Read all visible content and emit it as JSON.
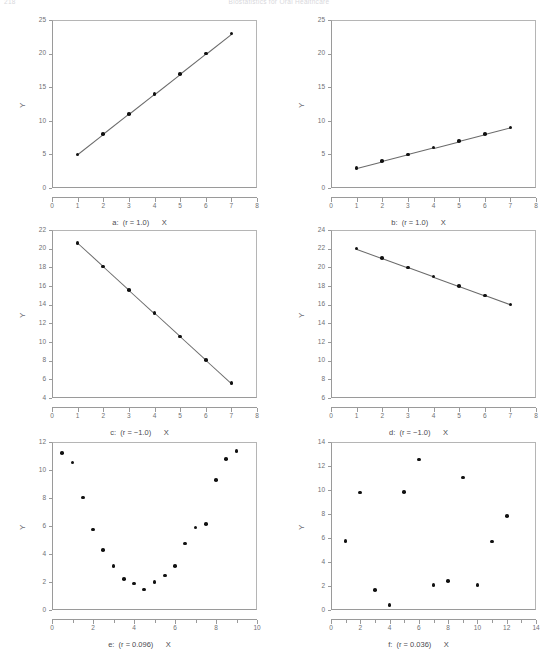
{
  "running_head": {
    "folio": "218",
    "title": "Biostatistics for Oral Healthcare"
  },
  "panels": [
    {
      "id": "a",
      "caption": "a:  (r = 1.0)      X",
      "ylabel": "Y"
    },
    {
      "id": "b",
      "caption": "b:  (r = 1.0)      X",
      "ylabel": "Y"
    },
    {
      "id": "c",
      "caption": "c:  (r = −1.0)      X",
      "ylabel": "Y"
    },
    {
      "id": "d",
      "caption": "d:  (r = −1.0)      X",
      "ylabel": "Y"
    },
    {
      "id": "e",
      "caption": "e:  (r = 0.096)      X",
      "ylabel": "Y"
    },
    {
      "id": "f",
      "caption": "f:  (r = 0.036)      X",
      "ylabel": "Y"
    }
  ],
  "chart_data": [
    {
      "type": "scatter",
      "panel": "a",
      "title": "a:  (r = 1.0)      X",
      "xlabel": "X",
      "ylabel": "Y",
      "xlim": [
        0,
        8
      ],
      "ylim": [
        0,
        25
      ],
      "xticks": [
        0,
        1,
        2,
        3,
        4,
        5,
        6,
        7,
        8
      ],
      "yticks": [
        0,
        5,
        10,
        15,
        20,
        25
      ],
      "grid": false,
      "legend": null,
      "connected": true,
      "x": [
        1,
        2,
        3,
        4,
        5,
        6,
        7
      ],
      "y": [
        5,
        8,
        11,
        14,
        17,
        20,
        23
      ],
      "annotation": "r = 1.0"
    },
    {
      "type": "scatter",
      "panel": "b",
      "title": "b:  (r = 1.0)      X",
      "xlabel": "X",
      "ylabel": "Y",
      "xlim": [
        0,
        8
      ],
      "ylim": [
        0,
        25
      ],
      "xticks": [
        0,
        1,
        2,
        3,
        4,
        5,
        6,
        7,
        8
      ],
      "yticks": [
        0,
        5,
        10,
        15,
        20,
        25
      ],
      "grid": false,
      "legend": null,
      "connected": true,
      "x": [
        1,
        2,
        3,
        4,
        5,
        6,
        7
      ],
      "y": [
        3,
        4,
        5,
        6,
        7,
        8,
        9
      ],
      "annotation": "r = 1.0"
    },
    {
      "type": "scatter",
      "panel": "c",
      "title": "c:  (r = −1.0)      X",
      "xlabel": "X",
      "ylabel": "Y",
      "xlim": [
        0,
        8
      ],
      "ylim": [
        4,
        22
      ],
      "xticks": [
        0,
        1,
        2,
        3,
        4,
        5,
        6,
        7,
        8
      ],
      "yticks": [
        4,
        6,
        8,
        10,
        12,
        14,
        16,
        18,
        20,
        22
      ],
      "grid": false,
      "legend": null,
      "connected": true,
      "x": [
        1,
        2,
        3,
        4,
        5,
        6,
        7
      ],
      "y": [
        20.6,
        18.1,
        15.6,
        13.1,
        10.6,
        8.1,
        5.6
      ],
      "annotation": "r = -1.0"
    },
    {
      "type": "scatter",
      "panel": "d",
      "title": "d:  (r = −1.0)      X",
      "xlabel": "X",
      "ylabel": "Y",
      "xlim": [
        0,
        8
      ],
      "ylim": [
        6,
        24
      ],
      "xticks": [
        0,
        1,
        2,
        3,
        4,
        5,
        6,
        7,
        8
      ],
      "yticks": [
        6,
        8,
        10,
        12,
        14,
        16,
        18,
        20,
        22,
        24
      ],
      "grid": false,
      "legend": null,
      "connected": true,
      "x": [
        1,
        2,
        3,
        4,
        5,
        6,
        7
      ],
      "y": [
        22,
        21,
        20,
        19,
        18,
        17,
        16
      ],
      "annotation": "r = -1.0"
    },
    {
      "type": "scatter",
      "panel": "e",
      "title": "e:  (r = 0.096)      X",
      "xlabel": "X",
      "ylabel": "Y",
      "xlim": [
        0,
        10
      ],
      "ylim": [
        0,
        12
      ],
      "xticks": [
        0,
        2,
        4,
        6,
        8,
        10
      ],
      "yticks": [
        0,
        2,
        4,
        6,
        8,
        10,
        12
      ],
      "grid": false,
      "legend": null,
      "connected": false,
      "x": [
        0.5,
        1.0,
        1.5,
        2.0,
        2.5,
        3.0,
        3.5,
        4.0,
        4.5,
        5.0,
        5.5,
        6.0,
        6.5,
        7.0,
        7.5,
        8.0,
        8.5,
        9.0
      ],
      "y": [
        11.2,
        10.55,
        8.05,
        5.75,
        4.3,
        3.15,
        2.2,
        1.9,
        1.45,
        2.0,
        2.45,
        3.15,
        4.75,
        5.9,
        6.15,
        9.3,
        10.8,
        11.35
      ],
      "annotation": "r = 0.096"
    },
    {
      "type": "scatter",
      "panel": "f",
      "title": "f:  (r = 0.036)      X",
      "xlabel": "X",
      "ylabel": "Y",
      "xlim": [
        0,
        14
      ],
      "ylim": [
        0,
        14
      ],
      "xticks": [
        0,
        2,
        4,
        6,
        8,
        10,
        12,
        14
      ],
      "yticks": [
        0,
        2,
        4,
        6,
        8,
        10,
        12,
        14
      ],
      "grid": false,
      "legend": null,
      "connected": false,
      "x": [
        1,
        2,
        3,
        4,
        5,
        6,
        7,
        8,
        9,
        10,
        11,
        12
      ],
      "y": [
        5.75,
        9.8,
        1.65,
        0.4,
        9.85,
        12.55,
        2.1,
        2.4,
        11.05,
        2.1,
        5.7,
        7.85
      ],
      "annotation": "r = 0.036"
    }
  ]
}
